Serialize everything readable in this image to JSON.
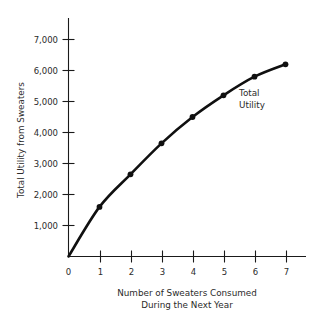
{
  "chart_data": {
    "type": "line",
    "title": "",
    "xlabel": "Number of Sweaters Consumed During the Next Year",
    "ylabel": "Total Utility from Sweaters",
    "x": [
      0,
      1,
      2,
      3,
      4,
      5,
      6,
      7
    ],
    "values": [
      0,
      1600,
      2650,
      3650,
      4500,
      5200,
      5800,
      6200
    ],
    "series": [
      {
        "name": "Total Utility",
        "values": [
          0,
          1600,
          2650,
          3650,
          4500,
          5200,
          5800,
          6200
        ]
      }
    ],
    "xlim": [
      0,
      7.6
    ],
    "ylim": [
      0,
      7400
    ],
    "grid": false,
    "legend": "none",
    "markers": true,
    "curve_color": "#101010",
    "annotations": [
      {
        "text_line1": "Total",
        "text_line2": "Utility",
        "near_x": 6,
        "near_y": 5300
      }
    ]
  },
  "axes": {
    "y_label_line1": "Total Utility from Sweaters",
    "y_tick_labels": [
      "1,000",
      "2,000",
      "3,000",
      "4,000",
      "5,000",
      "6,000",
      "7,000"
    ],
    "y_tick_values": [
      1000,
      2000,
      3000,
      4000,
      5000,
      6000,
      7000
    ],
    "x_tick_labels": [
      "0",
      "1",
      "2",
      "3",
      "4",
      "5",
      "6",
      "7"
    ],
    "x_tick_values": [
      0,
      1,
      2,
      3,
      4,
      5,
      6,
      7
    ],
    "x_title_line1": "Number of Sweaters Consumed",
    "x_title_line2": "During the Next Year",
    "origin_label": "0"
  },
  "annotation": {
    "series_label_line1": "Total",
    "series_label_line2": "Utility"
  }
}
